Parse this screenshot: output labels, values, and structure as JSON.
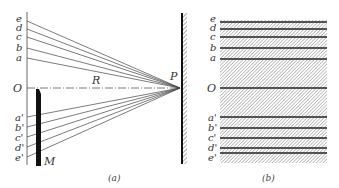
{
  "figure_a": {
    "caption": "(a)",
    "upper_labels": [
      "e",
      "d",
      "c",
      "b",
      "a"
    ],
    "upper_y": [
      18,
      28,
      37,
      48,
      58
    ],
    "lower_labels": [
      "a'",
      "b'",
      "c'",
      "d'",
      "e'"
    ],
    "lower_y": [
      117,
      128,
      138,
      148,
      158
    ],
    "origin_label": "O",
    "distance_label": "R",
    "point_label": "P",
    "mirror_label": "M"
  },
  "figure_b": {
    "caption": "(b)",
    "upper_labels": [
      "e",
      "d",
      "c",
      "b",
      "a"
    ],
    "upper_y": [
      20,
      29,
      38,
      48,
      59
    ],
    "lower_labels": [
      "a'",
      "b'",
      "c'",
      "d'",
      "e'"
    ],
    "lower_y": [
      117,
      128,
      138,
      148,
      157
    ],
    "origin_label": "O"
  },
  "colors": {
    "line": "#333333",
    "mirror": "#111111",
    "hatch": "#888888"
  }
}
